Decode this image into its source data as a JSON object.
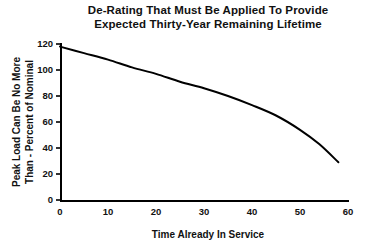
{
  "chart_data": {
    "type": "line",
    "title": "De-Rating That Must Be Applied To Provide Expected Thirty-Year Remaining Lifetime",
    "title_lines": [
      "De-Rating That Must Be Applied To Provide",
      "Expected Thirty-Year Remaining Lifetime"
    ],
    "xlabel": "Time Already In Service",
    "ylabel": "Peak Load Can Be No More Than - Percent of Nominal",
    "ylabel_lines": [
      "Peak Load Can Be No More",
      "Than - Percent of Nominal"
    ],
    "xlim": [
      0,
      60
    ],
    "ylim": [
      0,
      120
    ],
    "xticks": [
      0,
      10,
      20,
      30,
      40,
      50,
      60
    ],
    "yticks": [
      0,
      20,
      40,
      60,
      80,
      100,
      120
    ],
    "xtick_labels": [
      "0",
      "10",
      "20",
      "30",
      "40",
      "50",
      "60"
    ],
    "ytick_labels": [
      "0",
      "20",
      "40",
      "60",
      "80",
      "100",
      "120"
    ],
    "grid": false,
    "legend": false,
    "legend_position": "none",
    "line_color": "#000000",
    "background_color": "#ffffff",
    "series": [
      {
        "name": "De-rating curve",
        "x": [
          0,
          5,
          10,
          15,
          20,
          25,
          30,
          35,
          40,
          45,
          50,
          54,
          58
        ],
        "values": [
          118,
          113,
          108,
          102,
          97,
          91,
          86,
          80,
          73,
          65,
          54,
          43,
          29
        ]
      }
    ]
  },
  "plot_geometry": {
    "left": 60,
    "right": 348,
    "top": 44,
    "bottom": 200,
    "title_x": 208,
    "title_y1": 14,
    "title_y2": 28,
    "xlabel_x": 208,
    "xlabel_y": 238,
    "ylabel_x": 26,
    "ylabel_line_gap": 13
  }
}
